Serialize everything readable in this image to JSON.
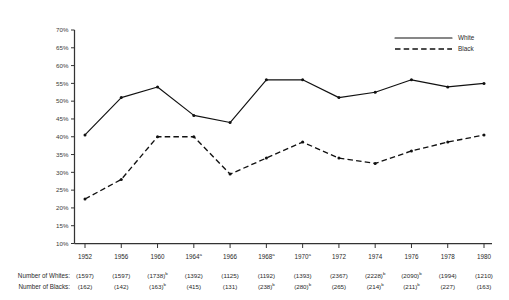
{
  "chart_data": {
    "type": "line",
    "title": "",
    "subtitle": "",
    "xlabel": "",
    "ylabel": "",
    "ylim": [
      10,
      70
    ],
    "ytick_step": 5,
    "grid": false,
    "legend_position": "top-right",
    "categories": [
      "1952",
      "1956",
      "1960",
      "1964",
      "1966",
      "1968",
      "1970",
      "1972",
      "1974",
      "1976",
      "1978",
      "1980"
    ],
    "category_superscripts": [
      "",
      "",
      "",
      "a",
      "",
      "a",
      "a",
      "",
      "",
      "",
      "",
      ""
    ],
    "ytick_labels": [
      "70%",
      "65%",
      "60%",
      "55%",
      "50%",
      "45%",
      "40%",
      "35%",
      "30%",
      "25%",
      "20%",
      "15%",
      "10%"
    ],
    "ytick_values": [
      70,
      65,
      60,
      55,
      50,
      45,
      40,
      35,
      30,
      25,
      20,
      15,
      10
    ],
    "series": [
      {
        "name": "White",
        "style": "solid",
        "values": [
          40.5,
          51.0,
          54.0,
          46.0,
          44.0,
          56.0,
          56.0,
          51.0,
          52.5,
          56.0,
          54.0,
          55.0
        ]
      },
      {
        "name": "Black",
        "style": "dashed",
        "values": [
          22.5,
          28.0,
          40.0,
          40.0,
          29.5,
          34.0,
          38.5,
          34.0,
          32.5,
          36.0,
          38.5,
          40.5
        ]
      }
    ],
    "annotations": {
      "row_labels": [
        "Number of Whites:",
        "Number of Blacks:"
      ],
      "rows": [
        {
          "label": "Number of Whites:",
          "cells": [
            {
              "value": "(1597)",
              "sup": ""
            },
            {
              "value": "(1597)",
              "sup": ""
            },
            {
              "value": "(1738)",
              "sup": "b"
            },
            {
              "value": "(1392)",
              "sup": ""
            },
            {
              "value": "(1125)",
              "sup": ""
            },
            {
              "value": "(1192)",
              "sup": ""
            },
            {
              "value": "(1393)",
              "sup": ""
            },
            {
              "value": "(2367)",
              "sup": ""
            },
            {
              "value": "(2228)",
              "sup": "b"
            },
            {
              "value": "(2090)",
              "sup": "b"
            },
            {
              "value": "(1994)",
              "sup": ""
            },
            {
              "value": "(1210)",
              "sup": ""
            }
          ]
        },
        {
          "label": "Number of Blacks:",
          "cells": [
            {
              "value": "(162)",
              "sup": ""
            },
            {
              "value": "(142)",
              "sup": ""
            },
            {
              "value": "(163)",
              "sup": "b"
            },
            {
              "value": "(415)",
              "sup": ""
            },
            {
              "value": "(131)",
              "sup": ""
            },
            {
              "value": "(238)",
              "sup": "b"
            },
            {
              "value": "(280)",
              "sup": "b"
            },
            {
              "value": "(265)",
              "sup": ""
            },
            {
              "value": "(214)",
              "sup": "b"
            },
            {
              "value": "(211)",
              "sup": "b"
            },
            {
              "value": "(227)",
              "sup": ""
            },
            {
              "value": "(163)",
              "sup": ""
            }
          ]
        }
      ]
    }
  },
  "legend": {
    "entries": [
      {
        "label": "White",
        "style": "solid"
      },
      {
        "label": "Black",
        "style": "dashed"
      }
    ]
  },
  "colors": {
    "line": "#111111",
    "axis": "#333333",
    "text": "#2a2a2a",
    "background": "#ffffff"
  }
}
